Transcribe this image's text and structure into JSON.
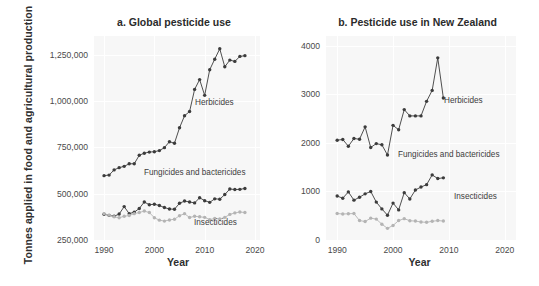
{
  "figure": {
    "ylabel": "Tonnes applied in food and agricultural production",
    "xlabel_a": "Year",
    "xlabel_b": "Year"
  },
  "chart_data": [
    {
      "type": "line",
      "title": "a. Global pesticide use",
      "xlabel": "Year",
      "ylabel": "Tonnes applied in food and agricultural production",
      "xlim": [
        1988,
        2021
      ],
      "ylim": [
        250000,
        1350000
      ],
      "xticks": [
        1990,
        2000,
        2010,
        2020
      ],
      "yticks": [
        250000,
        500000,
        750000,
        1000000,
        1250000
      ],
      "ytick_labels": [
        "250,000",
        "500,000",
        "750,000",
        "1,000,000",
        "1,250,000"
      ],
      "grid": true,
      "legend": "inline-annotations",
      "annotations": [
        "Herbicides",
        "Fungicides and bactericides",
        "Insecticides"
      ],
      "x": [
        1990,
        1991,
        1992,
        1993,
        1994,
        1995,
        1996,
        1997,
        1998,
        1999,
        2000,
        2001,
        2002,
        2003,
        2004,
        2005,
        2006,
        2007,
        2008,
        2009,
        2010,
        2011,
        2012,
        2013,
        2014,
        2015,
        2016,
        2017,
        2018
      ],
      "series": [
        {
          "name": "Herbicides",
          "color": "#3c3c3c",
          "values": [
            597000,
            600000,
            628000,
            640000,
            647000,
            661000,
            661000,
            707000,
            718000,
            724000,
            726000,
            732000,
            748000,
            780000,
            772000,
            855000,
            920000,
            943000,
            1062000,
            1115000,
            1030000,
            1168000,
            1225000,
            1281000,
            1184000,
            1220000,
            1213000,
            1240000,
            1244000,
            1238000,
            1205000
          ]
        },
        {
          "name": "Fungicides and bactericides",
          "color": "#3c3c3c",
          "values": [
            389000,
            383000,
            378000,
            390000,
            430000,
            392000,
            400000,
            420000,
            455000,
            440000,
            443000,
            436000,
            425000,
            417000,
            416000,
            448000,
            460000,
            455000,
            450000,
            478000,
            462000,
            453000,
            472000,
            470000,
            495000,
            525000,
            522000,
            523000,
            528000,
            532000,
            531000
          ]
        },
        {
          "name": "Insecticides",
          "color": "#b4b4b4",
          "values": [
            392000,
            384000,
            375000,
            370000,
            378000,
            382000,
            392000,
            398000,
            406000,
            398000,
            370000,
            357000,
            352000,
            358000,
            362000,
            381000,
            392000,
            371000,
            378000,
            375000,
            372000,
            360000,
            366000,
            363000,
            372000,
            388000,
            396000,
            401000,
            398000,
            402000,
            398000
          ]
        }
      ]
    },
    {
      "type": "line",
      "title": "b. Pesticide use in New Zealand",
      "xlabel": "Year",
      "ylabel": "Tonnes applied in food and agricultural production",
      "xlim": [
        1988,
        2022
      ],
      "ylim": [
        0,
        4200
      ],
      "xticks": [
        1990,
        2000,
        2010,
        2020
      ],
      "yticks": [
        0,
        1000,
        2000,
        3000,
        4000
      ],
      "ytick_labels": [
        "0",
        "1000",
        "2000",
        "3000",
        "4000"
      ],
      "grid": true,
      "legend": "inline-annotations",
      "annotations": [
        "Herbicides",
        "Fungicides and bactericides",
        "Insecticides"
      ],
      "x": [
        1990,
        1991,
        1992,
        1993,
        1994,
        1995,
        1996,
        1997,
        1998,
        1999,
        2000,
        2001,
        2002,
        2003,
        2004,
        2005,
        2006,
        2007,
        2008,
        2009
      ],
      "series": [
        {
          "name": "Herbicides",
          "color": "#3c3c3c",
          "values": [
            2055,
            2070,
            1930,
            2090,
            2075,
            2330,
            1905,
            1985,
            1960,
            1750,
            2360,
            2270,
            2685,
            2555,
            2555,
            2555,
            2855,
            3080,
            3750,
            2925
          ]
        },
        {
          "name": "Fungicides and bactericides",
          "color": "#3c3c3c",
          "values": [
            905,
            860,
            990,
            820,
            880,
            950,
            1000,
            780,
            640,
            510,
            760,
            620,
            975,
            845,
            1030,
            1090,
            1140,
            1340,
            1265,
            1280
          ]
        },
        {
          "name": "Insecticides",
          "color": "#b4b4b4",
          "values": [
            545,
            535,
            540,
            545,
            400,
            380,
            450,
            430,
            325,
            240,
            300,
            400,
            440,
            395,
            390,
            370,
            365,
            385,
            400,
            390
          ]
        }
      ]
    }
  ]
}
